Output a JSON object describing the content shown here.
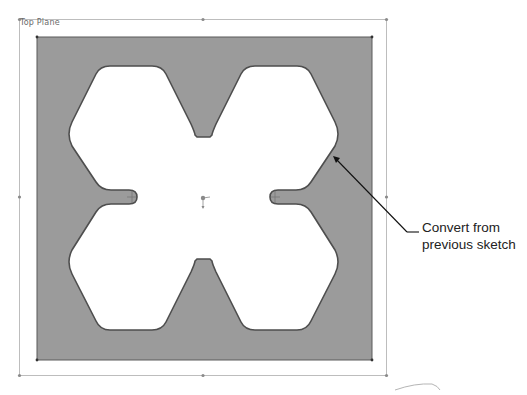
{
  "viewport": {
    "plane_label": "Top Plane"
  },
  "sketch": {
    "plate_color": "#9a9a9a",
    "outline_color": "#555555",
    "hole_color": "#ffffff",
    "frame_color": "#b8b8b8"
  },
  "annotation": {
    "line1": "Convert from",
    "line2": "previous sketch",
    "leader_color": "#111111"
  }
}
